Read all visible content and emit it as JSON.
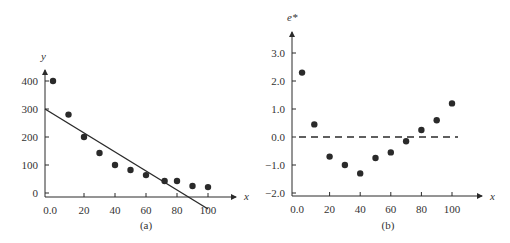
{
  "chart_data": [
    {
      "type": "scatter",
      "panel": "a",
      "caption": "(a)",
      "xlabel": "x",
      "ylabel": "y",
      "xlim": [
        0,
        100
      ],
      "ylim": [
        0,
        400
      ],
      "x_ticks": [
        "0.0",
        "20",
        "40",
        "60",
        "80",
        "100"
      ],
      "y_ticks": [
        "0",
        "100",
        "200",
        "300",
        "400"
      ],
      "grid": false,
      "series": [
        {
          "name": "observations",
          "x": [
            0,
            10,
            20,
            30,
            40,
            50,
            60,
            72,
            80,
            90,
            100
          ],
          "y": [
            400,
            280,
            200,
            143,
            100,
            82,
            64,
            43,
            43,
            25,
            21
          ]
        }
      ],
      "fit_line": {
        "x": [
          -5,
          100
        ],
        "y": [
          300,
          -43
        ]
      }
    },
    {
      "type": "scatter",
      "panel": "b",
      "caption": "(b)",
      "xlabel": "x",
      "ylabel": "e*",
      "xlim": [
        0,
        100
      ],
      "ylim": [
        -2.0,
        3.0
      ],
      "x_ticks": [
        "0.0",
        "20",
        "40",
        "60",
        "80",
        "100"
      ],
      "y_ticks": [
        "3.0",
        "2.0",
        "1.0",
        "0.0",
        "−1.0",
        "−2.0"
      ],
      "grid": false,
      "series": [
        {
          "name": "residuals",
          "x": [
            2,
            10,
            20,
            30,
            40,
            50,
            60,
            70,
            80,
            90,
            100
          ],
          "y": [
            2.3,
            0.45,
            -0.7,
            -1.0,
            -1.3,
            -0.75,
            -0.55,
            -0.15,
            0.25,
            0.6,
            1.2
          ]
        }
      ],
      "reference_line": {
        "y": 0.0,
        "style": "dashed"
      }
    }
  ]
}
